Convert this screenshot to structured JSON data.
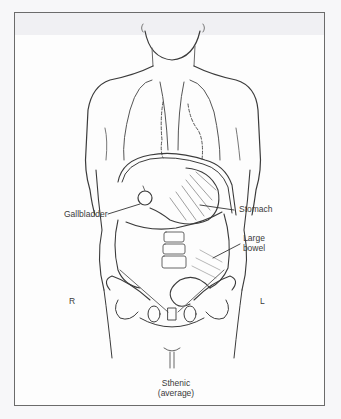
{
  "diagram": {
    "type": "anatomical-illustration",
    "labels": {
      "gallbladder": "Gallbladder",
      "stomach": "Stomach",
      "large_bowel_line1": "Large",
      "large_bowel_line2": "bowel",
      "right": "R",
      "left": "L"
    },
    "caption": {
      "line1": "Sthenic",
      "line2": "(average)"
    }
  },
  "colors": {
    "line": "#3b3b3b",
    "border": "#6b6b6b",
    "background": "#fdfdfd"
  }
}
